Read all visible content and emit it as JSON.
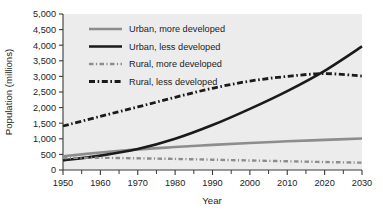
{
  "chart_data": {
    "type": "line",
    "title": "",
    "xlabel": "Year",
    "ylabel": "Population (millions)",
    "xlim": [
      1950,
      2030
    ],
    "ylim": [
      0,
      5000
    ],
    "grid": false,
    "legend_position": "top-center-inside",
    "x_ticks": [
      1950,
      1960,
      1970,
      1980,
      1990,
      2000,
      2010,
      2020,
      2030
    ],
    "x_tick_labels": [
      "1950",
      "1960",
      "1970",
      "1980",
      "1990",
      "2000",
      "2010",
      "2020",
      "2030"
    ],
    "x_minor_ticks": [
      1955,
      1965,
      1975,
      1985,
      1995,
      2005,
      2015,
      2025
    ],
    "y_ticks": [
      0,
      500,
      1000,
      1500,
      2000,
      2500,
      3000,
      3500,
      4000,
      4500,
      5000
    ],
    "y_tick_labels": [
      "0",
      "500",
      "1,000",
      "1,500",
      "2,000",
      "2,500",
      "3,000",
      "3,500",
      "4,000",
      "4,500",
      "5,000"
    ],
    "x": [
      1950,
      1960,
      1970,
      1980,
      1990,
      2000,
      2010,
      2020,
      2030
    ],
    "series": [
      {
        "name": "Urban, more developed",
        "color": "#8d8d8d",
        "style": "solid",
        "width": 2.6,
        "values": [
          440,
          560,
          660,
          735,
          805,
          865,
          920,
          965,
          1010
        ]
      },
      {
        "name": "Urban, less developed",
        "color": "#1a1a1a",
        "style": "solid",
        "width": 2.6,
        "values": [
          310,
          460,
          670,
          1000,
          1440,
          1960,
          2530,
          3180,
          3960
        ]
      },
      {
        "name": "Rural, more developed",
        "color": "#8d8d8d",
        "style": "dashdot",
        "width": 2.4,
        "values": [
          385,
          390,
          375,
          355,
          330,
          305,
          280,
          255,
          235
        ]
      },
      {
        "name": "Rural, less developed",
        "color": "#1a1a1a",
        "style": "dashdot",
        "width": 2.8,
        "values": [
          1410,
          1720,
          2020,
          2330,
          2620,
          2850,
          3000,
          3090,
          3010
        ]
      }
    ]
  },
  "legend": {
    "items": [
      {
        "label": "Urban, more developed"
      },
      {
        "label": "Urban, less developed"
      },
      {
        "label": "Rural, more developed"
      },
      {
        "label": "Rural, less developed"
      }
    ]
  },
  "axes": {
    "x_title": "Year",
    "y_title": "Population (millions)"
  }
}
